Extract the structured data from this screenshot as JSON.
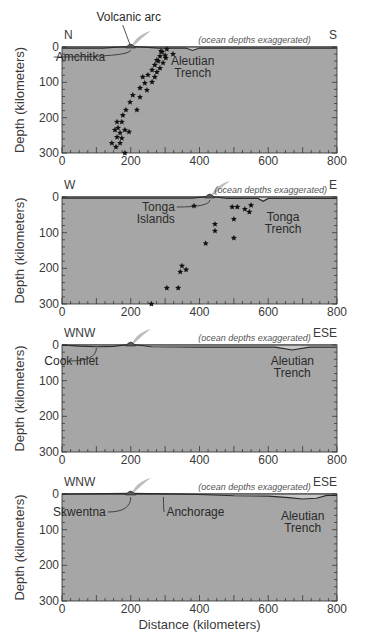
{
  "colors": {
    "plot_fill": "#a6a6a6",
    "ocean_fill": "#c8c8c8",
    "line": "#2a2a2a",
    "plume": "#bdbdbd",
    "star": "#111111"
  },
  "chart_data": [
    {
      "type": "scatter",
      "title": "",
      "left_direction": "N",
      "right_direction": "S",
      "note": "(ocean depths exaggerated)",
      "xlabel": "",
      "ylabel": "Depth (kilometers)",
      "xlim": [
        0,
        800
      ],
      "ylim": [
        0,
        300
      ],
      "x_ticks": [
        "0",
        "200",
        "400",
        "600",
        "800"
      ],
      "y_ticks": [
        "0",
        "100",
        "200",
        "300"
      ],
      "volcano_x": 200,
      "annotations": [
        {
          "text": "Volcanic arc",
          "x": 200,
          "depth": 0,
          "role": "volcano-label"
        },
        {
          "text": "Amchitka",
          "x": 200,
          "depth": 0,
          "role": "arrow-label"
        },
        {
          "text": "Aleutian",
          "x": 380,
          "depth": 0,
          "role": "trench-label-1"
        },
        {
          "text": "Trench",
          "x": 380,
          "depth": 0,
          "role": "trench-label-2"
        }
      ],
      "surface_profile": [
        [
          0,
          3
        ],
        [
          120,
          3
        ],
        [
          200,
          -2
        ],
        [
          280,
          3
        ],
        [
          360,
          3
        ],
        [
          380,
          10
        ],
        [
          400,
          3
        ],
        [
          800,
          3
        ]
      ],
      "points": [
        [
          305,
          6
        ],
        [
          291,
          14
        ],
        [
          285,
          26
        ],
        [
          323,
          20
        ],
        [
          302,
          31
        ],
        [
          276,
          37
        ],
        [
          294,
          45
        ],
        [
          270,
          51
        ],
        [
          285,
          60
        ],
        [
          262,
          65
        ],
        [
          276,
          71
        ],
        [
          250,
          79
        ],
        [
          270,
          85
        ],
        [
          235,
          85
        ],
        [
          262,
          99
        ],
        [
          241,
          102
        ],
        [
          227,
          116
        ],
        [
          247,
          122
        ],
        [
          206,
          136
        ],
        [
          227,
          142
        ],
        [
          198,
          156
        ],
        [
          218,
          178
        ],
        [
          186,
          178
        ],
        [
          177,
          193
        ],
        [
          174,
          212
        ],
        [
          160,
          212
        ],
        [
          163,
          229
        ],
        [
          154,
          235
        ],
        [
          183,
          235
        ],
        [
          169,
          243
        ],
        [
          195,
          240
        ],
        [
          160,
          255
        ],
        [
          174,
          258
        ],
        [
          145,
          272
        ],
        [
          169,
          272
        ],
        [
          157,
          283
        ],
        [
          183,
          300
        ],
        [
          288,
          12
        ],
        [
          300,
          24
        ],
        [
          280,
          40
        ]
      ]
    },
    {
      "type": "scatter",
      "title": "",
      "left_direction": "W",
      "right_direction": "E",
      "note": "(ocean depths exaggerated)",
      "xlabel": "",
      "ylabel": "Depth (kilometers)",
      "xlim": [
        0,
        800
      ],
      "ylim": [
        0,
        300
      ],
      "x_ticks": [
        "0",
        "200",
        "400",
        "600",
        "800"
      ],
      "y_ticks": [
        "0",
        "100",
        "200",
        "300"
      ],
      "volcano_x": 430,
      "annotations": [
        {
          "text": "Tonga",
          "x": 430,
          "depth": 0,
          "role": "arc-label-1"
        },
        {
          "text": "Islands",
          "x": 430,
          "depth": 0,
          "role": "arc-label-2"
        },
        {
          "text": "Tonga",
          "x": 585,
          "depth": 0,
          "role": "trench-label-1"
        },
        {
          "text": "Trench",
          "x": 585,
          "depth": 0,
          "role": "trench-label-2"
        }
      ],
      "surface_profile": [
        [
          0,
          3
        ],
        [
          380,
          3
        ],
        [
          430,
          -2
        ],
        [
          480,
          4
        ],
        [
          570,
          4
        ],
        [
          585,
          12
        ],
        [
          600,
          4
        ],
        [
          800,
          4
        ]
      ],
      "points": [
        [
          384,
          25
        ],
        [
          445,
          76
        ],
        [
          445,
          95
        ],
        [
          418,
          130
        ],
        [
          495,
          28
        ],
        [
          510,
          28
        ],
        [
          532,
          34
        ],
        [
          545,
          42
        ],
        [
          550,
          23
        ],
        [
          500,
          62
        ],
        [
          500,
          115
        ],
        [
          349,
          193
        ],
        [
          344,
          210
        ],
        [
          361,
          204
        ],
        [
          305,
          255
        ],
        [
          338,
          255
        ],
        [
          260,
          300
        ]
      ]
    },
    {
      "type": "scatter",
      "title": "",
      "left_direction": "WNW",
      "right_direction": "ESE",
      "note": "(ocean depths exaggerated)",
      "xlabel": "",
      "ylabel": "Depth (kilometers)",
      "xlim": [
        0,
        800
      ],
      "ylim": [
        0,
        300
      ],
      "x_ticks": [
        "0",
        "200",
        "400",
        "600",
        "800"
      ],
      "y_ticks": [
        "0",
        "100",
        "200",
        "300"
      ],
      "volcano_x": 200,
      "annotations": [
        {
          "text": "Cook Inlet",
          "x": 100,
          "depth": 0,
          "role": "arrow-label"
        },
        {
          "text": "Aleutian",
          "x": 670,
          "depth": 0,
          "role": "trench-label-1"
        },
        {
          "text": "Trench",
          "x": 670,
          "depth": 0,
          "role": "trench-label-2"
        }
      ],
      "surface_profile": [
        [
          0,
          0
        ],
        [
          50,
          3
        ],
        [
          100,
          5
        ],
        [
          150,
          4
        ],
        [
          200,
          -2
        ],
        [
          260,
          5
        ],
        [
          400,
          6
        ],
        [
          620,
          6
        ],
        [
          670,
          14
        ],
        [
          720,
          6
        ],
        [
          800,
          6
        ]
      ],
      "points": []
    },
    {
      "type": "scatter",
      "title": "",
      "left_direction": "WNW",
      "right_direction": "ESE",
      "note": "(ocean depths exaggerated)",
      "xlabel": "Distance (kilometers)",
      "ylabel": "Depth (kilometers)",
      "xlim": [
        0,
        800
      ],
      "ylim": [
        0,
        300
      ],
      "x_ticks": [
        "0",
        "200",
        "400",
        "600",
        "800"
      ],
      "y_ticks": [
        "0",
        "100",
        "200",
        "300"
      ],
      "volcano_x": 200,
      "annotations": [
        {
          "text": "Skwentna",
          "x": 200,
          "depth": 0,
          "role": "arrow-label"
        },
        {
          "text": "Anchorage",
          "x": 295,
          "depth": 0,
          "role": "arrow-label-2"
        },
        {
          "text": "Aleutian",
          "x": 700,
          "depth": 0,
          "role": "trench-label-1"
        },
        {
          "text": "Trench",
          "x": 700,
          "depth": 0,
          "role": "trench-label-2"
        }
      ],
      "surface_profile": [
        [
          0,
          0
        ],
        [
          200,
          -2
        ],
        [
          350,
          0
        ],
        [
          420,
          2
        ],
        [
          500,
          5
        ],
        [
          600,
          6
        ],
        [
          660,
          10
        ],
        [
          700,
          14
        ],
        [
          740,
          12
        ],
        [
          770,
          4
        ],
        [
          800,
          4
        ]
      ],
      "points": []
    }
  ]
}
